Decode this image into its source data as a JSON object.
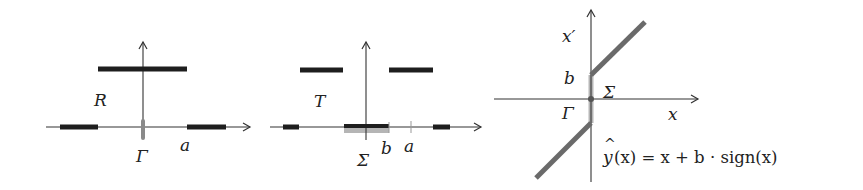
{
  "colors": {
    "ink": "#222222",
    "thin_axis": "#333333",
    "thick_bar": "#1e1e1e",
    "gray_set": "#b5b5b5",
    "graph_line": "#6a6a6a"
  },
  "panels": [
    {
      "id": "panel-R",
      "set_label": "R",
      "axis_point_label": "Γ",
      "tick_label": "a"
    },
    {
      "id": "panel-T",
      "set_label": "T",
      "gray_set_label": "Σ",
      "tick_label_b": "b",
      "tick_label_a": "a"
    },
    {
      "id": "panel-graph",
      "y_axis_label": "x′",
      "x_axis_label": "x",
      "b_label": "b",
      "sigma_label": "Σ",
      "gamma_label": "Γ",
      "formula": {
        "lhs": "y",
        "hat": "^",
        "arg": "(x) = x + b · sign(x)"
      }
    }
  ]
}
